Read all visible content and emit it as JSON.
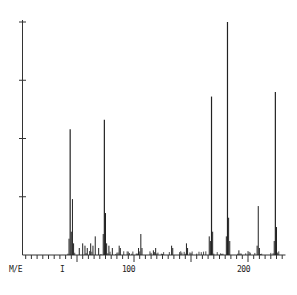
{
  "chart_data": {
    "type": "bar",
    "subtype": "mass-spectrum-stick",
    "title": "",
    "xlabel": "M/E",
    "ylabel": "",
    "x_tick_labels": [
      "100",
      "200"
    ],
    "x_minor_marker": "I",
    "xlim": [
      0,
      232
    ],
    "ylim": [
      0,
      100
    ],
    "y_ticks": [
      25,
      50,
      75,
      100
    ],
    "grid": false,
    "legend": null,
    "peaks": [
      {
        "x": 43,
        "y": 7
      },
      {
        "x": 44,
        "y": 54
      },
      {
        "x": 45,
        "y": 10
      },
      {
        "x": 46,
        "y": 24
      },
      {
        "x": 47,
        "y": 5
      },
      {
        "x": 52,
        "y": 3
      },
      {
        "x": 55,
        "y": 5
      },
      {
        "x": 57,
        "y": 4
      },
      {
        "x": 59,
        "y": 3
      },
      {
        "x": 62,
        "y": 5
      },
      {
        "x": 64,
        "y": 4
      },
      {
        "x": 66,
        "y": 8
      },
      {
        "x": 69,
        "y": 3
      },
      {
        "x": 73,
        "y": 9
      },
      {
        "x": 74,
        "y": 58
      },
      {
        "x": 75,
        "y": 18
      },
      {
        "x": 76,
        "y": 5
      },
      {
        "x": 78,
        "y": 4
      },
      {
        "x": 81,
        "y": 3
      },
      {
        "x": 87,
        "y": 4
      },
      {
        "x": 88,
        "y": 3
      },
      {
        "x": 104,
        "y": 3
      },
      {
        "x": 106,
        "y": 9
      },
      {
        "x": 107,
        "y": 3
      },
      {
        "x": 117,
        "y": 2
      },
      {
        "x": 119,
        "y": 3
      },
      {
        "x": 133,
        "y": 4
      },
      {
        "x": 134,
        "y": 3
      },
      {
        "x": 146,
        "y": 5
      },
      {
        "x": 147,
        "y": 3
      },
      {
        "x": 166,
        "y": 8
      },
      {
        "x": 167,
        "y": 6
      },
      {
        "x": 168,
        "y": 68
      },
      {
        "x": 169,
        "y": 10
      },
      {
        "x": 181,
        "y": 8
      },
      {
        "x": 182,
        "y": 100
      },
      {
        "x": 183,
        "y": 16
      },
      {
        "x": 184,
        "y": 6
      },
      {
        "x": 192,
        "y": 2
      },
      {
        "x": 208,
        "y": 4
      },
      {
        "x": 209,
        "y": 21
      },
      {
        "x": 210,
        "y": 3
      },
      {
        "x": 223,
        "y": 6
      },
      {
        "x": 224,
        "y": 70
      },
      {
        "x": 225,
        "y": 12
      }
    ]
  },
  "labels": {
    "x_axis": "M/E",
    "marker": "I",
    "tick_100": "100",
    "tick_200": "200"
  }
}
